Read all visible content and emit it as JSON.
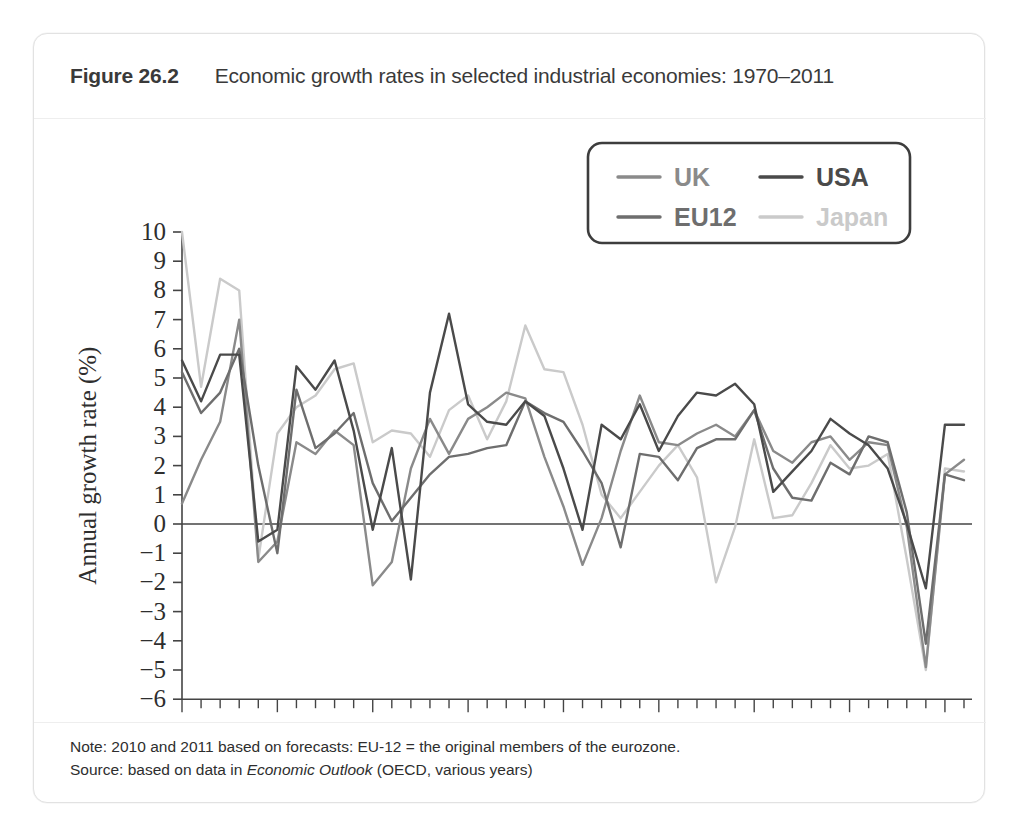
{
  "figure": {
    "number": "Figure 26.2",
    "title": "Economic growth rates in selected industrial economies: 1970–2011"
  },
  "footer": {
    "note_prefix": "Note: 2010 and 2011 based on forecasts: EU-12 = the original members of the eurozone.",
    "source_prefix": "Source: based on data in ",
    "source_italic": "Economic Outlook",
    "source_suffix": " (OECD, various years)"
  },
  "colors": {
    "uk": "#8a8a8a",
    "usa": "#4a4a4a",
    "eu12": "#6e6e6e",
    "japan": "#cacaca",
    "axis": "#444444",
    "text": "#2e2e2e",
    "card_border": "#e2e2e2",
    "legend_border": "#3d3d3d"
  },
  "chart_data": {
    "type": "line",
    "title": "Economic growth rates in selected industrial economies: 1970–2011",
    "xlabel": "",
    "ylabel": "Annual growth rate (%)",
    "xlim": [
      1970,
      2011
    ],
    "ylim": [
      -6,
      10
    ],
    "grid": false,
    "zero_line": true,
    "legend_position": "top-right",
    "x_tick_labels": [
      "1970",
      "1975",
      "1980",
      "1985",
      "1990",
      "1995",
      "2000",
      "2005",
      "2010"
    ],
    "x_tick_values": [
      1970,
      1975,
      1980,
      1985,
      1990,
      1995,
      2000,
      2005,
      2010
    ],
    "x_minor_tick_step": 1,
    "y_tick_labels": [
      "10",
      "9",
      "8",
      "7",
      "6",
      "5",
      "4",
      "3",
      "2",
      "1",
      "0",
      "−1",
      "−2",
      "−3",
      "−4",
      "−5",
      "−6"
    ],
    "y_tick_values": [
      10,
      9,
      8,
      7,
      6,
      5,
      4,
      3,
      2,
      1,
      0,
      -1,
      -2,
      -3,
      -4,
      -5,
      -6
    ],
    "x": [
      1970,
      1971,
      1972,
      1973,
      1974,
      1975,
      1976,
      1977,
      1978,
      1979,
      1980,
      1981,
      1982,
      1983,
      1984,
      1985,
      1986,
      1987,
      1988,
      1989,
      1990,
      1991,
      1992,
      1993,
      1994,
      1995,
      1996,
      1997,
      1998,
      1999,
      2000,
      2001,
      2002,
      2003,
      2004,
      2005,
      2006,
      2007,
      2008,
      2009,
      2010,
      2011
    ],
    "series": [
      {
        "name": "UK",
        "color": "#8a8a8a",
        "values": [
          0.7,
          2.2,
          3.5,
          7.0,
          -1.3,
          -0.6,
          2.8,
          2.4,
          3.2,
          2.7,
          -2.1,
          -1.3,
          1.9,
          3.6,
          2.4,
          3.6,
          4.0,
          4.5,
          4.3,
          2.3,
          0.6,
          -1.4,
          0.2,
          2.5,
          4.4,
          2.8,
          2.7,
          3.1,
          3.4,
          3.0,
          3.9,
          2.5,
          2.1,
          2.8,
          3.0,
          2.2,
          2.8,
          2.7,
          -0.1,
          -4.9,
          1.7,
          2.2
        ]
      },
      {
        "name": "USA",
        "color": "#4a4a4a",
        "values": [
          5.6,
          4.2,
          5.8,
          5.8,
          -0.6,
          -0.2,
          5.4,
          4.6,
          5.6,
          3.2,
          -0.2,
          2.6,
          -1.9,
          4.5,
          7.2,
          4.1,
          3.5,
          3.4,
          4.2,
          3.7,
          1.9,
          -0.2,
          3.4,
          2.9,
          4.1,
          2.5,
          3.7,
          4.5,
          4.4,
          4.8,
          4.1,
          1.1,
          1.8,
          2.5,
          3.6,
          3.1,
          2.7,
          1.9,
          0.0,
          -2.2,
          3.4,
          3.4
        ]
      },
      {
        "name": "EU12",
        "color": "#6e6e6e",
        "values": [
          5.2,
          3.8,
          4.5,
          6.0,
          2.0,
          -1.0,
          4.6,
          2.6,
          3.1,
          3.8,
          1.4,
          0.1,
          0.9,
          1.7,
          2.3,
          2.4,
          2.6,
          2.7,
          4.2,
          3.8,
          3.5,
          2.5,
          1.4,
          -0.8,
          2.4,
          2.3,
          1.5,
          2.6,
          2.9,
          2.9,
          3.9,
          1.9,
          0.9,
          0.8,
          2.1,
          1.7,
          3.0,
          2.8,
          0.4,
          -4.1,
          1.7,
          1.5
        ]
      },
      {
        "name": "Japan",
        "color": "#cacaca",
        "values": [
          10.0,
          4.7,
          8.4,
          8.0,
          -1.2,
          3.1,
          4.0,
          4.4,
          5.3,
          5.5,
          2.8,
          3.2,
          3.1,
          2.3,
          3.9,
          4.4,
          2.9,
          4.2,
          6.8,
          5.3,
          5.2,
          3.4,
          1.0,
          0.2,
          1.1,
          2.0,
          2.7,
          1.6,
          -2.0,
          -0.1,
          2.9,
          0.2,
          0.3,
          1.4,
          2.7,
          1.9,
          2.0,
          2.4,
          -1.2,
          -5.0,
          1.9,
          1.8
        ]
      }
    ]
  },
  "legend": {
    "entries": [
      {
        "label": "UK",
        "color": "#8a8a8a"
      },
      {
        "label": "USA",
        "color": "#4a4a4a"
      },
      {
        "label": "EU12",
        "color": "#6e6e6e"
      },
      {
        "label": "Japan",
        "color": "#cacaca"
      }
    ]
  }
}
